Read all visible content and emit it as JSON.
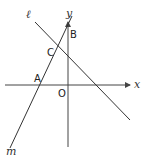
{
  "diagram": {
    "type": "coordinate-geometry",
    "axes": {
      "x_label": "x",
      "y_label": "y",
      "origin_label": "O"
    },
    "lines": [
      {
        "name": "line-l",
        "label": "ℓ"
      },
      {
        "name": "line-m",
        "label": "m"
      }
    ],
    "points": {
      "A": "A",
      "B": "B",
      "C": "C"
    },
    "colors": {
      "stroke": "#333333",
      "text": "#222222",
      "background": "#ffffff"
    }
  }
}
